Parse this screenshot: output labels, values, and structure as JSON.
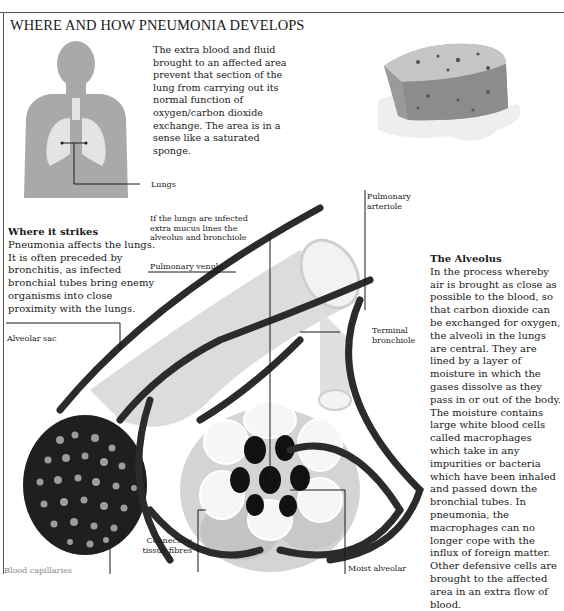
{
  "page": {
    "title": "WHERE AND HOW PNEUMONIA DEVELOPS"
  },
  "intro": {
    "text": "The extra blood and fluid brought to an affected area prevent that section of the lung from carrying out its normal function of oxygen/carbon dioxide exchange. The area is in a sense like a saturated sponge."
  },
  "where_it_strikes": {
    "heading": "Where it strikes",
    "text": "Pneumonia affects the lungs. It is often preceded by bronchitis, as infected bronchial tubes bring enemy organisms into close proximity with the lungs."
  },
  "the_alveolus": {
    "heading": "The Alveolus",
    "text": "In the process whereby air is brought as close as possible to the blood, so that carbon dioxide can be exchanged for oxygen, the alveoli in the lungs are central. They are lined by a layer of moisture in which the gases dissolve as they pass in or out of the body. The moisture contains large white blood cells called macrophages which take in any impurities or bacteria which have been inhaled and passed down the bronchial tubes. In pneumonia, the macrophages can no longer cope with the influx of foreign matter. Other defensive cells are brought to the affected area in an extra flow of blood."
  },
  "labels": {
    "lungs": "Lungs",
    "mucus_note": "If the lungs are infected extra mucus lines the alveolus and bronchiole",
    "pulmonary_venule": "Pulmonary venule",
    "pulmonary_arteriole": "Pulmonary arteriole",
    "alveolar_sac": "Alveolar sac",
    "terminal_bronchiole": "Terminal bronchiole",
    "connective_tissue_fibres": "Connective tissue fibres",
    "blood_capillaries": "Blood capillaries",
    "moist_alveolar": "Moist alveolar"
  },
  "illustrations": {
    "body_silhouette": "human-torso-with-lungs",
    "sponge": "saturated-sponge",
    "alveolus_diagram": "alveolus-cross-section"
  },
  "colors": {
    "silhouette": "#a9a9a9",
    "lungs": "#e4e4e4",
    "ink": "#1a1a1a",
    "vessel_dark": "#2b2b2b",
    "tissue_light": "#d8d8d8"
  }
}
